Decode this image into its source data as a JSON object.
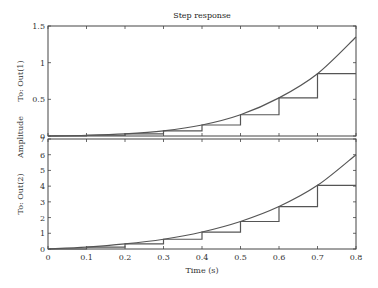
{
  "chart_data": {
    "type": "line",
    "title": "Step response",
    "xlabel": "Time (s)",
    "ylabel": "Amplitude",
    "xlim": [
      0,
      0.8
    ],
    "x_ticks": [
      "0",
      "0.1",
      "0.2",
      "0.3",
      "0.4",
      "0.5",
      "0.6",
      "0.7",
      "0.8"
    ],
    "grid": false,
    "legend": null,
    "subplots": [
      {
        "label": "To: Out(1)",
        "ylim": [
          0,
          1.5
        ],
        "y_ticks": [
          "0",
          "0.5",
          "1",
          "1.5"
        ],
        "series": [
          {
            "name": "continuous",
            "style": "line",
            "x": [
              0,
              0.1,
              0.2,
              0.3,
              0.4,
              0.5,
              0.6,
              0.7,
              0.8
            ],
            "values": [
              0,
              0.01,
              0.03,
              0.07,
              0.15,
              0.29,
              0.52,
              0.85,
              1.35
            ]
          },
          {
            "name": "discrete",
            "style": "step",
            "x": [
              0,
              0.1,
              0.2,
              0.3,
              0.4,
              0.5,
              0.6,
              0.7,
              0.8
            ],
            "values": [
              0,
              0.01,
              0.03,
              0.07,
              0.15,
              0.29,
              0.52,
              0.85,
              0.85
            ]
          }
        ]
      },
      {
        "label": "To: Out(2)",
        "ylim": [
          0,
          7
        ],
        "y_ticks": [
          "0",
          "1",
          "2",
          "3",
          "4",
          "5",
          "6",
          "7"
        ],
        "series": [
          {
            "name": "continuous",
            "style": "line",
            "x": [
              0,
              0.1,
              0.2,
              0.3,
              0.4,
              0.5,
              0.6,
              0.7,
              0.8
            ],
            "values": [
              0,
              0.12,
              0.32,
              0.62,
              1.08,
              1.75,
              2.7,
              4.05,
              6.0
            ]
          },
          {
            "name": "discrete",
            "style": "step",
            "x": [
              0,
              0.1,
              0.2,
              0.3,
              0.4,
              0.5,
              0.6,
              0.7,
              0.8
            ],
            "values": [
              0,
              0.12,
              0.32,
              0.62,
              1.08,
              1.75,
              2.7,
              4.05,
              4.05
            ]
          }
        ]
      }
    ]
  },
  "colors": {
    "axis": "#444444",
    "line": "#555555"
  }
}
